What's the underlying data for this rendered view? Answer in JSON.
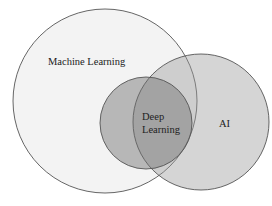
{
  "diagram": {
    "type": "venn",
    "sets": [
      {
        "id": "ml",
        "label": "Machine Learning",
        "cx": 105,
        "cy": 101,
        "r": 92,
        "fill": "#bdbdbd",
        "opacity": 0.18
      },
      {
        "id": "ai",
        "label": "AI",
        "cx": 201,
        "cy": 122,
        "r": 68,
        "fill": "#9a9a9a",
        "opacity": 0.42
      },
      {
        "id": "dl",
        "label_line1": "Deep",
        "label_line2": "Learning",
        "cx": 146,
        "cy": 123,
        "r": 46,
        "fill": "#6e6e6e",
        "opacity": 0.45
      }
    ],
    "stroke": "#555555"
  }
}
